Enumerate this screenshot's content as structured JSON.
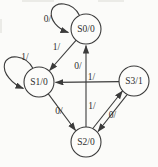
{
  "diagram": {
    "type": "state-transition-diagram",
    "states": [
      {
        "id": "S0",
        "label": "S0/0"
      },
      {
        "id": "S1",
        "label": "S1/0"
      },
      {
        "id": "S2",
        "label": "S2/0"
      },
      {
        "id": "S3",
        "label": "S3/1"
      }
    ],
    "transitions": [
      {
        "from": "S0",
        "to": "S0",
        "label": "0/"
      },
      {
        "from": "S1",
        "to": "S1",
        "label": "1/"
      },
      {
        "from": "S0",
        "to": "S1",
        "label": "1/"
      },
      {
        "from": "S2",
        "to": "S0",
        "label": "0/"
      },
      {
        "from": "S3",
        "to": "S1",
        "label": "1/"
      },
      {
        "from": "S1",
        "to": "S2",
        "label": "0/"
      },
      {
        "from": "S2",
        "to": "S3",
        "label": "1/"
      },
      {
        "from": "S3",
        "to": "S2",
        "label": "0/"
      }
    ],
    "colors": {
      "stroke": "#3b3b3b",
      "text": "#2e2e2e",
      "background": "#fbfbf9"
    }
  }
}
